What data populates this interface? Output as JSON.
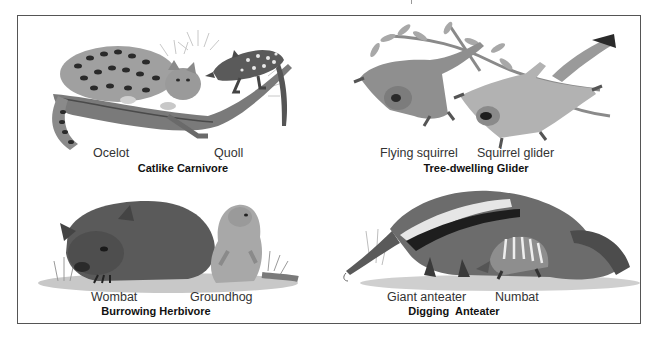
{
  "figure": {
    "panels": [
      {
        "id": "catlike-carnivore",
        "title": "Catlike Carnivore",
        "animals": [
          "Ocelot",
          "Quoll"
        ]
      },
      {
        "id": "tree-dwelling-glider",
        "title": "Tree-dwelling Glider",
        "animals": [
          "Flying squirrel",
          "Squirrel glider"
        ]
      },
      {
        "id": "burrowing-herbivore",
        "title": "Burrowing Herbivore",
        "animals": [
          "Wombat",
          "Groundhog"
        ]
      },
      {
        "id": "digging-anteater",
        "title": "Digging  Anteater",
        "animals": [
          "Giant anteater",
          "Numbat"
        ]
      }
    ],
    "colors": {
      "border": "#555555",
      "ink_dark": "#2a2a2a",
      "ink_mid": "#6b6b6b",
      "ink_light": "#b5b5b5",
      "background": "#ffffff"
    }
  }
}
